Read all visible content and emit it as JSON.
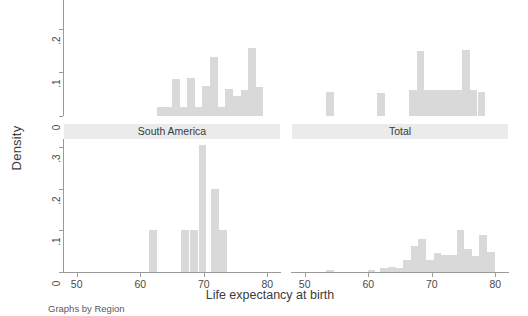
{
  "figure": {
    "ylabel": "Density",
    "xlabel": "Life expectancy at birth",
    "note": "Graphs by Region",
    "bar_color": "#d9d9d9",
    "strip_color": "#ebebeb",
    "axis_color": "#9a9a9a"
  },
  "panels": [
    {
      "id": "panel-top-left",
      "title": "",
      "title_visible": false,
      "yticks": [
        "0",
        ".1",
        ".2",
        ".3"
      ],
      "xticks": [
        "50",
        "60",
        "70",
        "80"
      ]
    },
    {
      "id": "panel-top-right",
      "title": "",
      "title_visible": false,
      "yticks": [
        "0",
        ".1",
        ".2",
        ".3"
      ],
      "xticks": [
        "50",
        "60",
        "70",
        "80"
      ]
    },
    {
      "id": "panel-south-america",
      "title": "South America",
      "title_visible": true,
      "yticks": [
        "0",
        ".1",
        ".2",
        ".3"
      ],
      "xticks": [
        "50",
        "60",
        "70",
        "80"
      ]
    },
    {
      "id": "panel-total",
      "title": "Total",
      "title_visible": true,
      "yticks": [
        "0",
        ".1",
        ".2",
        ".3"
      ],
      "xticks": [
        "50",
        "60",
        "70",
        "80"
      ]
    }
  ],
  "chart_data": {
    "type": "bar",
    "chart_kind": "histogram-small-multiples",
    "title": "",
    "xlabel": "Life expectancy at birth",
    "ylabel": "Density",
    "note": "Graphs by Region",
    "xlim": [
      48,
      82
    ],
    "ylim": [
      0,
      0.32
    ],
    "bin_width": 1.2,
    "grid": false,
    "legend": "none",
    "panels": [
      {
        "name": "panel-top-left",
        "title": "",
        "title_visible": false,
        "x": [
          63.2,
          64.4,
          65.6,
          66.8,
          68.0,
          69.2,
          70.4,
          71.6,
          72.8,
          74.0,
          75.2,
          76.4,
          77.6,
          78.8
        ],
        "values": [
          0.02,
          0.02,
          0.084,
          0.02,
          0.086,
          0.02,
          0.068,
          0.135,
          0.02,
          0.062,
          0.046,
          0.06,
          0.155,
          0.066
        ]
      },
      {
        "name": "panel-top-right",
        "title": "",
        "title_visible": false,
        "x": [
          54.0,
          62.0,
          67.0,
          68.2,
          69.4,
          70.6,
          71.8,
          73.0,
          74.2,
          75.4,
          76.6,
          77.8
        ],
        "values": [
          0.055,
          0.052,
          0.06,
          0.148,
          0.06,
          0.06,
          0.06,
          0.06,
          0.06,
          0.152,
          0.06,
          0.055
        ]
      },
      {
        "name": "panel-south-america",
        "title": "South America",
        "title_visible": true,
        "x": [
          62.0,
          67.0,
          68.5,
          69.8,
          71.8,
          73.0
        ],
        "values": [
          0.1,
          0.1,
          0.1,
          0.305,
          0.2,
          0.1
        ]
      },
      {
        "name": "panel-total",
        "title": "Total",
        "title_visible": true,
        "x": [
          54.0,
          60.5,
          62.5,
          63.7,
          64.9,
          66.1,
          67.3,
          68.5,
          69.7,
          70.9,
          72.1,
          73.3,
          74.5,
          75.7,
          76.9,
          78.1,
          79.3
        ],
        "values": [
          0.006,
          0.006,
          0.01,
          0.012,
          0.01,
          0.03,
          0.062,
          0.08,
          0.03,
          0.045,
          0.042,
          0.04,
          0.1,
          0.055,
          0.038,
          0.09,
          0.048
        ]
      }
    ]
  }
}
